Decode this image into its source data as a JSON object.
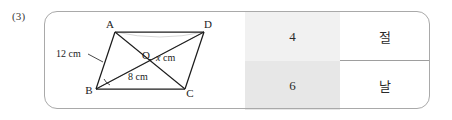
{
  "problem": {
    "number_label": "(3)"
  },
  "figure": {
    "shape_name": "parallelogram-abcd-with-diagonals",
    "vertices": [
      {
        "name": "A",
        "label": "A",
        "x": 115,
        "y": 32,
        "label_x": 110,
        "label_y": 27
      },
      {
        "name": "D",
        "label": "D",
        "x": 204,
        "y": 32,
        "label_x": 207,
        "label_y": 27
      },
      {
        "name": "B",
        "label": "B",
        "x": 96,
        "y": 89,
        "label_x": 87,
        "label_y": 92
      },
      {
        "name": "C",
        "label": "C",
        "x": 185,
        "y": 89,
        "label_x": 188,
        "label_y": 95
      }
    ],
    "center_point": {
      "name": "O",
      "label": "O",
      "x": 150,
      "y": 60,
      "label_x": 144,
      "label_y": 58
    },
    "dimensions": [
      {
        "name": "side-ab-length",
        "text": "12 cm",
        "x": 56,
        "y": 56
      },
      {
        "name": "diagonal-bd-length",
        "text": "8 cm",
        "x": 128,
        "y": 79
      },
      {
        "name": "unknown-segment-length",
        "italic_part": "x",
        "unit_part": " cm",
        "x": 158,
        "y": 60
      }
    ],
    "angle_mark_at": "B"
  },
  "answer_table": {
    "rows": [
      {
        "value": "4",
        "syllable": "절"
      },
      {
        "value": "6",
        "syllable": "날"
      }
    ]
  },
  "colors": {
    "box_border": "#a9a9a9",
    "shade_top": "#f1f1f1",
    "shade_bottom": "#e7e7e7",
    "divider": "#9e9e9e",
    "ink": "#1c1c1c"
  }
}
